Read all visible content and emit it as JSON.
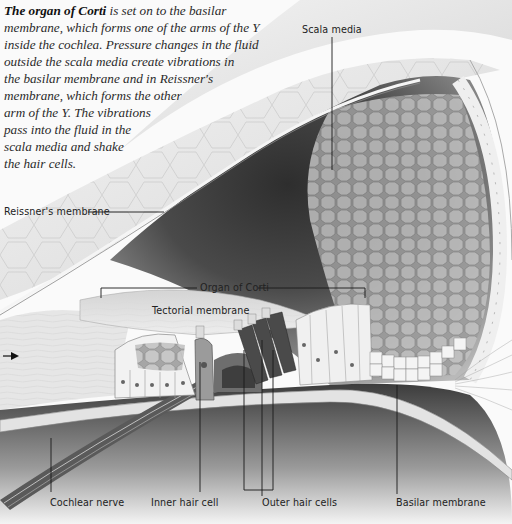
{
  "caption": {
    "lead": "The organ of Corti",
    "lines": [
      " is set on to the basilar",
      "membrane, which forms one of the arms of the Y",
      "inside the cochlea. Pressure changes in the fluid",
      "outside the scala media create vibrations in",
      "the basilar membrane and in Reissner's",
      "membrane, which forms the other",
      "arm of the Y. The vibrations",
      "pass into the fluid in the",
      "scala media and shake",
      "the hair cells."
    ]
  },
  "labels": {
    "scala_media": "Scala media",
    "reissners_membrane": "Reissner's membrane",
    "organ_of_corti": "Organ of Corti",
    "tectorial_membrane": "Tectorial membrane",
    "cochlear_nerve": "Cochlear nerve",
    "inner_hair_cell": "Inner hair cell",
    "outer_hair_cells": "Outer hair cells",
    "basilar_membrane": "Basilar membrane"
  },
  "colors": {
    "background": "#fafafa",
    "scala_dark": "#3a3a3a",
    "cell_fill": "#bdbdbd",
    "leader_line": "#1a1a1a"
  }
}
